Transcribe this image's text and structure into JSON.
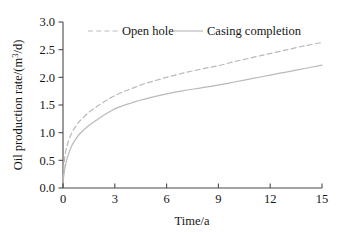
{
  "chart_data": {
    "type": "line",
    "title": "",
    "xlabel": "Time/a",
    "ylabel": "Oil production rate/(m³/d)",
    "ylabel_parts": {
      "prefix": "Oil production rate/(m",
      "superscript": "3",
      "suffix": "/d)"
    },
    "xlim": [
      0,
      15
    ],
    "ylim": [
      0,
      3.0
    ],
    "xticks": [
      0,
      3,
      6,
      9,
      12,
      15
    ],
    "yticks": [
      0.0,
      0.5,
      1.0,
      1.5,
      2.0,
      2.5,
      3.0
    ],
    "xtick_labels": [
      "0",
      "3",
      "6",
      "9",
      "12",
      "15"
    ],
    "ytick_labels": [
      "0.0",
      "0.5",
      "1.0",
      "1.5",
      "2.0",
      "2.5",
      "3.0"
    ],
    "grid": false,
    "legend_position": "top-center-inside",
    "x": [
      0,
      0.1,
      0.25,
      0.5,
      0.75,
      1,
      1.5,
      2,
      2.5,
      3,
      3.5,
      4,
      4.5,
      5,
      6,
      7,
      8,
      9,
      10,
      11,
      12,
      13,
      14,
      15
    ],
    "series": [
      {
        "name": "Open hole",
        "style": "dashed",
        "color": "#b9b9b9",
        "values": [
          0.18,
          0.55,
          0.78,
          0.99,
          1.12,
          1.22,
          1.37,
          1.48,
          1.58,
          1.67,
          1.74,
          1.8,
          1.86,
          1.91,
          2.0,
          2.08,
          2.15,
          2.21,
          2.29,
          2.36,
          2.43,
          2.5,
          2.57,
          2.63
        ]
      },
      {
        "name": "Casing completion",
        "style": "solid",
        "color": "#b9b9b9",
        "values": [
          0.1,
          0.34,
          0.55,
          0.76,
          0.89,
          0.99,
          1.13,
          1.24,
          1.34,
          1.43,
          1.49,
          1.54,
          1.59,
          1.63,
          1.7,
          1.76,
          1.81,
          1.86,
          1.92,
          1.98,
          2.04,
          2.1,
          2.16,
          2.22
        ]
      }
    ]
  },
  "legend": {
    "items": [
      {
        "label": "Open hole",
        "style": "dashed"
      },
      {
        "label": "Casing completion",
        "style": "solid"
      }
    ]
  },
  "axis": {
    "x_title": "Time/a",
    "y_title": "Oil production rate/(m3/d)"
  },
  "colors": {
    "curve": "#b9b9b9",
    "axis": "#4a4a4a",
    "text": "#161616",
    "background": "#ffffff"
  }
}
